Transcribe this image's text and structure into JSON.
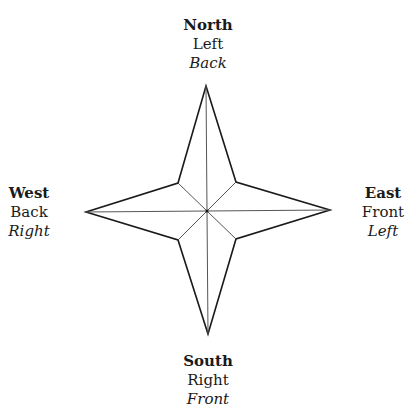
{
  "diagram": {
    "type": "compass-rose",
    "points": {
      "north": {
        "direction": "North",
        "line2": "Left",
        "line3": "Back"
      },
      "east": {
        "direction": "East",
        "line2": "Front",
        "line3": "Left"
      },
      "south": {
        "direction": "South",
        "line2": "Right",
        "line3": "Front"
      },
      "west": {
        "direction": "West",
        "line2": "Back",
        "line3": "Right"
      }
    },
    "colors": {
      "outline": "#1a1a1a",
      "inner_lines": "#555555",
      "background": "#ffffff"
    }
  }
}
